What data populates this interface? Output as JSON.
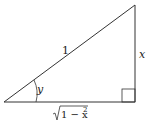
{
  "diagram": {
    "type": "right-triangle",
    "hypotenuse_label": "1",
    "opposite_label": "x",
    "angle_label": "y",
    "adjacent_label_radicand": "1 − x",
    "adjacent_label_exponent": "2",
    "stroke_color": "#333333"
  }
}
